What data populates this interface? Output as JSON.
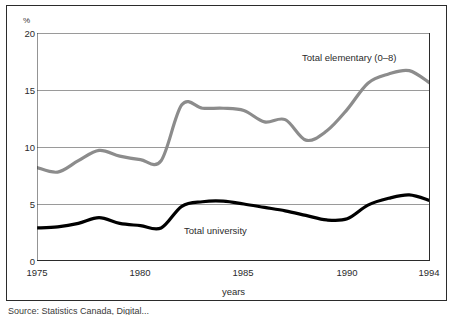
{
  "chart_data": {
    "type": "line",
    "title": "",
    "subtitle": "",
    "xlabel": "years",
    "ylabel": "",
    "unit_label": "%",
    "xlim": [
      1975,
      1994
    ],
    "ylim": [
      0,
      20
    ],
    "yticks": [
      0,
      5,
      10,
      15,
      20
    ],
    "xticks": [
      1975,
      1980,
      1985,
      1990,
      1994
    ],
    "xtick_all": [
      1975,
      1976,
      1977,
      1978,
      1979,
      1980,
      1981,
      1982,
      1983,
      1984,
      1985,
      1986,
      1987,
      1988,
      1989,
      1990,
      1991,
      1992,
      1993,
      1994
    ],
    "grid": "horizontal",
    "legend_position": "inline-annotations",
    "x": [
      1975,
      1976,
      1977,
      1978,
      1979,
      1980,
      1981,
      1982,
      1983,
      1984,
      1985,
      1986,
      1987,
      1988,
      1989,
      1990,
      1991,
      1992,
      1993,
      1994
    ],
    "series": [
      {
        "name": "Total elementary (0–8)",
        "color": "#8c8c8c",
        "width": 3.2,
        "values": [
          8.2,
          7.8,
          8.8,
          9.7,
          9.2,
          8.9,
          8.8,
          13.7,
          13.4,
          13.4,
          13.2,
          12.2,
          12.4,
          10.6,
          11.4,
          13.3,
          15.6,
          16.4,
          16.7,
          15.6
        ]
      },
      {
        "name": "Total university",
        "color": "#000000",
        "width": 3.2,
        "values": [
          2.9,
          3.0,
          3.3,
          3.8,
          3.3,
          3.1,
          2.9,
          4.8,
          5.2,
          5.25,
          5.0,
          4.7,
          4.4,
          4.0,
          3.6,
          3.7,
          4.9,
          5.5,
          5.8,
          5.3
        ]
      }
    ],
    "annotations": [
      {
        "text": "Total elementary (0–8)",
        "x": 1991,
        "y": 18.0
      },
      {
        "text": "Total university",
        "x": 1983,
        "y": 2.5
      }
    ]
  },
  "axes": {
    "unit_label": "%",
    "x_title": "years",
    "y_tick_labels": [
      "20",
      "15",
      "10",
      "5",
      "0"
    ],
    "x_tick_labels": [
      "1975",
      "1980",
      "1985",
      "1990",
      "1994"
    ]
  },
  "labels": {
    "elementary": "Total elementary (0–8)",
    "university": "Total university"
  },
  "source": {
    "note": "Source:  Statistics Canada, Digital..."
  },
  "colors": {
    "elementary_line": "#8c8c8c",
    "university_line": "#000000",
    "gridline": "#9a9a9a",
    "axis": "#2b2b2b",
    "frame": "#2b2b2b",
    "background": "#ffffff"
  }
}
